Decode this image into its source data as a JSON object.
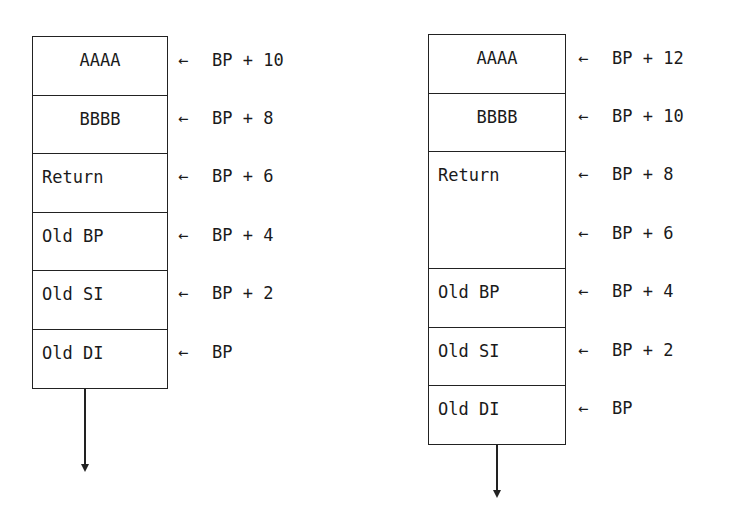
{
  "left_stack": {
    "cells": [
      {
        "text": "AAAA",
        "align": "center"
      },
      {
        "text": "BBBB",
        "align": "center"
      },
      {
        "text": "Return",
        "align": "left"
      },
      {
        "text": "Old BP",
        "align": "left"
      },
      {
        "text": "Old SI",
        "align": "left"
      },
      {
        "text": "Old DI",
        "align": "left"
      }
    ],
    "pointers": [
      {
        "arrow": "←",
        "text": "BP + 10"
      },
      {
        "arrow": "←",
        "text": "BP + 8"
      },
      {
        "arrow": "←",
        "text": "BP + 6"
      },
      {
        "arrow": "←",
        "text": "BP + 4"
      },
      {
        "arrow": "←",
        "text": "BP + 2"
      },
      {
        "arrow": "←",
        "text": "BP"
      }
    ]
  },
  "right_stack": {
    "cells": [
      {
        "text": "AAAA",
        "align": "center"
      },
      {
        "text": "BBBB",
        "align": "center"
      },
      {
        "text": "Return",
        "align": "left"
      },
      {
        "text": "Old BP",
        "align": "left"
      },
      {
        "text": "Old SI",
        "align": "left"
      },
      {
        "text": "Old DI",
        "align": "left"
      }
    ],
    "pointers": [
      {
        "arrow": "←",
        "text": "BP + 12"
      },
      {
        "arrow": "←",
        "text": "BP + 10"
      },
      {
        "arrow": "←",
        "text": "BP + 8"
      },
      {
        "arrow": "←",
        "text": "BP + 6"
      },
      {
        "arrow": "←",
        "text": "BP + 4"
      },
      {
        "arrow": "←",
        "text": "BP + 2"
      },
      {
        "arrow": "←",
        "text": "BP"
      }
    ]
  }
}
